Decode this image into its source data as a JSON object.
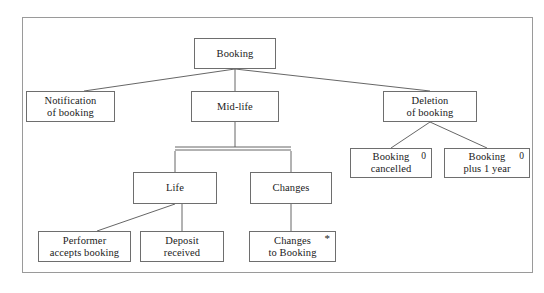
{
  "diagram": {
    "type": "entity-life-history",
    "frame": {
      "visible": true,
      "border_color": "#9a9a9a"
    },
    "colors": {
      "box_border": "#6e6e6e",
      "box_fill": "#ffffff",
      "edge": "#555555",
      "text": "#1a1a1a",
      "frame_border": "#9a9a9a"
    },
    "nodes": [
      {
        "id": "booking",
        "name": "booking",
        "lines": [
          "Booking"
        ],
        "marker": "",
        "x": 194,
        "y": 38,
        "w": 82,
        "h": 31
      },
      {
        "id": "notification",
        "name": "notification-of-booking",
        "lines": [
          "Notification",
          "of booking"
        ],
        "marker": "",
        "x": 26,
        "y": 91,
        "w": 89,
        "h": 31
      },
      {
        "id": "midlife",
        "name": "mid-life",
        "lines": [
          "Mid-life"
        ],
        "marker": "",
        "x": 191,
        "y": 91,
        "w": 88,
        "h": 31
      },
      {
        "id": "deletion",
        "name": "deletion-of-booking",
        "lines": [
          "Deletion",
          "of booking"
        ],
        "marker": "",
        "x": 383,
        "y": 91,
        "w": 94,
        "h": 31
      },
      {
        "id": "booking-cancelled",
        "name": "booking-cancelled",
        "lines": [
          "Booking",
          "cancelled"
        ],
        "marker": "0",
        "x": 350,
        "y": 148,
        "w": 82,
        "h": 30
      },
      {
        "id": "booking-plus-1-year",
        "name": "booking-plus-1-year",
        "lines": [
          "Booking",
          "plus 1 year"
        ],
        "marker": "0",
        "x": 444,
        "y": 148,
        "w": 86,
        "h": 30
      },
      {
        "id": "life",
        "name": "life",
        "lines": [
          "Life"
        ],
        "marker": "",
        "x": 133,
        "y": 172,
        "w": 84,
        "h": 32
      },
      {
        "id": "changes",
        "name": "changes",
        "lines": [
          "Changes"
        ],
        "marker": "",
        "x": 250,
        "y": 172,
        "w": 82,
        "h": 32
      },
      {
        "id": "performer-accepts",
        "name": "performer-accepts-booking",
        "lines": [
          "Performer",
          "accepts booking"
        ],
        "marker": "",
        "x": 38,
        "y": 231,
        "w": 93,
        "h": 31
      },
      {
        "id": "deposit-received",
        "name": "deposit-received",
        "lines": [
          "Deposit",
          "received"
        ],
        "marker": "",
        "x": 140,
        "y": 231,
        "w": 84,
        "h": 31
      },
      {
        "id": "changes-to-booking",
        "name": "changes-to-booking",
        "lines": [
          "Changes",
          "to Booking"
        ],
        "marker": "*",
        "x": 249,
        "y": 231,
        "w": 87,
        "h": 31
      }
    ],
    "edges": [
      {
        "id": "booking-notification",
        "name": "edge-booking-to-notification",
        "from": "booking",
        "to": "notification",
        "x1": 235,
        "y1": 69,
        "x2": 84,
        "y2": 91
      },
      {
        "id": "booking-midlife",
        "name": "edge-booking-to-mid-life",
        "from": "booking",
        "to": "midlife",
        "x1": 235,
        "y1": 69,
        "x2": 235,
        "y2": 91
      },
      {
        "id": "booking-deletion",
        "name": "edge-booking-to-deletion",
        "from": "booking",
        "to": "deletion",
        "x1": 235,
        "y1": 69,
        "x2": 430,
        "y2": 91
      },
      {
        "id": "deletion-cancelled",
        "name": "edge-deletion-to-booking-cancelled",
        "from": "deletion",
        "to": "booking-cancelled",
        "x1": 430,
        "y1": 122,
        "x2": 391,
        "y2": 148
      },
      {
        "id": "deletion-plus1",
        "name": "edge-deletion-to-booking-plus-1-year",
        "from": "deletion",
        "to": "booking-plus-1-year",
        "x1": 430,
        "y1": 122,
        "x2": 487,
        "y2": 148
      },
      {
        "id": "midlife-bar",
        "name": "edge-mid-life-to-and-bar",
        "from": "midlife",
        "to": "and-bar",
        "x1": 235,
        "y1": 122,
        "x2": 235,
        "y2": 147
      },
      {
        "id": "bar-life",
        "name": "edge-and-bar-to-life",
        "from": "and-bar",
        "to": "life",
        "x1": 175,
        "y1": 151,
        "x2": 175,
        "y2": 172
      },
      {
        "id": "bar-changes",
        "name": "edge-and-bar-to-changes",
        "from": "and-bar",
        "to": "changes",
        "x1": 291,
        "y1": 151,
        "x2": 291,
        "y2": 172
      },
      {
        "id": "life-performer",
        "name": "edge-life-to-performer-accepts-booking",
        "from": "life",
        "to": "performer-accepts",
        "x1": 175,
        "y1": 204,
        "x2": 97,
        "y2": 231
      },
      {
        "id": "life-deposit",
        "name": "edge-life-to-deposit-received",
        "from": "life",
        "to": "deposit-received",
        "x1": 182,
        "y1": 204,
        "x2": 182,
        "y2": 231
      },
      {
        "id": "changes-changes",
        "name": "edge-changes-to-changes-to-booking",
        "from": "changes",
        "to": "changes-to-booking",
        "x1": 291,
        "y1": 204,
        "x2": 291,
        "y2": 231
      }
    ],
    "and_bar": {
      "name": "and-decomposition-bar",
      "x1": 175,
      "x2": 291,
      "y": 147,
      "gap": 3
    },
    "caption": " "
  }
}
